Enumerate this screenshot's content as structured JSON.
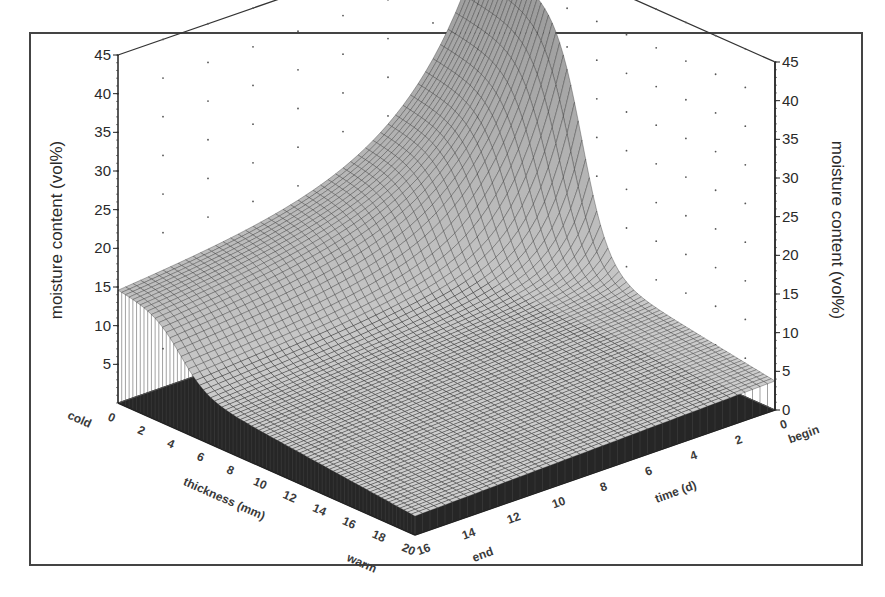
{
  "chart_data": {
    "type": "surface3d",
    "title": "",
    "z_axis": {
      "label": "moisture content (vol%)",
      "range": [
        0,
        45
      ],
      "ticks": [
        5,
        10,
        15,
        20,
        25,
        30,
        35,
        40,
        45
      ],
      "tick_labels": [
        "5",
        "10",
        "15",
        "20",
        "25",
        "30",
        "35",
        "40",
        "45"
      ],
      "right_tick_labels": [
        "0",
        "5",
        "10",
        "15",
        "20",
        "25",
        "30",
        "35",
        "40",
        "45"
      ]
    },
    "x_axis": {
      "label": "thickness (mm)",
      "range": [
        0,
        20
      ],
      "ticks": [
        0,
        2,
        4,
        6,
        8,
        10,
        12,
        14,
        16,
        18,
        20
      ],
      "tick_labels": [
        "0",
        "2",
        "4",
        "6",
        "8",
        "10",
        "12",
        "14",
        "16",
        "18",
        "20"
      ],
      "start_label": "cold",
      "end_label": "warm"
    },
    "y_axis": {
      "label": "time (d)",
      "range": [
        0,
        16
      ],
      "ticks": [
        0,
        2,
        4,
        6,
        8,
        10,
        12,
        14,
        16
      ],
      "tick_labels": [
        "0",
        "2",
        "4",
        "6",
        "8",
        "10",
        "12",
        "14",
        "16"
      ],
      "start_label": "begin",
      "end_label": "end"
    },
    "surface": {
      "description": "Moisture content vs. thickness and time: at time 0 the cold side (thickness 0) is ~42 vol%, falling steeply (sigmoid) to ~10 vol% around thickness 6-8; over time the whole profile collapses toward ~0 near the end; the warm side stays near 0-10 vol%.",
      "initial_value_cold": 42,
      "plateau_value": 10,
      "transition_thickness": 7,
      "final_value": 0
    },
    "grid": true,
    "legend": "none"
  }
}
